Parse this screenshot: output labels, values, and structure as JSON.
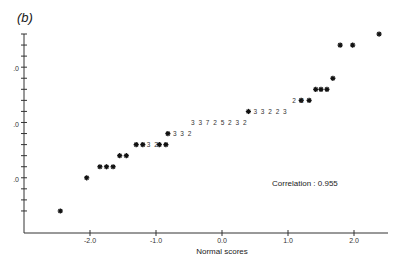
{
  "panel_label": "(b)",
  "chart_data": {
    "type": "scatter",
    "title": "",
    "panel": "(b)",
    "xlabel": "Normal scores",
    "ylabel": "",
    "x_ticks": [
      "-2.0",
      "-1.0",
      "0.0",
      "1.0",
      "2.0"
    ],
    "y_tick_labels_visible": [
      ".0",
      ".0",
      ".0"
    ],
    "xlim": [
      -2.7,
      2.5
    ],
    "grid": false,
    "annotation": "Correlation : 0.955",
    "marker": "asterisk",
    "points": [
      {
        "x": -2.45,
        "y": 0
      },
      {
        "x": -2.05,
        "y": 3
      },
      {
        "x": -1.85,
        "y": 4
      },
      {
        "x": -1.75,
        "y": 4
      },
      {
        "x": -1.65,
        "y": 4
      },
      {
        "x": -1.55,
        "y": 5
      },
      {
        "x": -1.45,
        "y": 5
      },
      {
        "x": -1.3,
        "y": 6
      },
      {
        "x": -1.2,
        "y": 6
      },
      {
        "x": -0.95,
        "y": 6
      },
      {
        "x": -0.85,
        "y": 6
      },
      {
        "x": -0.82,
        "y": 7
      },
      {
        "x": 0.4,
        "y": 9
      },
      {
        "x": 1.2,
        "y": 10
      },
      {
        "x": 1.32,
        "y": 10
      },
      {
        "x": 1.42,
        "y": 11
      },
      {
        "x": 1.5,
        "y": 11
      },
      {
        "x": 1.59,
        "y": 11
      },
      {
        "x": 1.68,
        "y": 12
      },
      {
        "x": 1.79,
        "y": 15
      },
      {
        "x": 1.98,
        "y": 15
      },
      {
        "x": 2.38,
        "y": 16
      }
    ],
    "count_labels": [
      {
        "text": "3 2",
        "after_point_x": -1.2
      },
      {
        "text": "3 3 2",
        "after_point_x": -0.82
      },
      {
        "text": "3 3 7   2 5 2 3 2",
        "x": -0.1
      },
      {
        "text": "3 3 2 2 3",
        "after_point_x": 0.4
      },
      {
        "text": "2",
        "before_point_x": 1.2
      },
      {
        "text": "2",
        "before_point_x": 1.32
      }
    ]
  }
}
